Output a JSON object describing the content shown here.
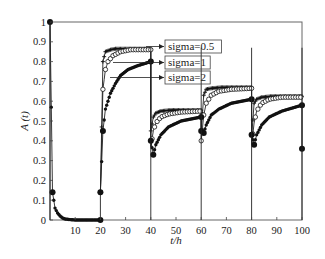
{
  "chart_data": {
    "type": "line",
    "title": "",
    "xlabel": "t/h",
    "ylabel": "A (t)",
    "xlim": [
      0,
      100
    ],
    "ylim": [
      0,
      1
    ],
    "xticks": [
      10,
      20,
      30,
      40,
      50,
      60,
      70,
      80,
      90,
      100
    ],
    "yticks": [
      0,
      0.1,
      0.2,
      0.3,
      0.4,
      0.5,
      0.6,
      0.7,
      0.8,
      0.9,
      1
    ],
    "grid": false,
    "legend_position": "annotations with arrows, upper middle",
    "series": [
      {
        "name": "sigma=0.5",
        "marker": "plus",
        "segments": [
          {
            "x": [
              20,
              21,
              22,
              24,
              26,
              30,
              35,
              40
            ],
            "y": [
              0.14,
              0.8,
              0.85,
              0.86,
              0.865,
              0.865,
              0.865,
              0.865
            ]
          },
          {
            "x": [
              40,
              41,
              42,
              44,
              48,
              55,
              60
            ],
            "y": [
              0.45,
              0.52,
              0.54,
              0.55,
              0.555,
              0.555,
              0.555
            ]
          },
          {
            "x": [
              60,
              61,
              62,
              64,
              68,
              75,
              80
            ],
            "y": [
              0.45,
              0.63,
              0.66,
              0.665,
              0.67,
              0.67,
              0.67
            ]
          },
          {
            "x": [
              80,
              81,
              82,
              84,
              88,
              95,
              100
            ],
            "y": [
              0.42,
              0.59,
              0.61,
              0.62,
              0.625,
              0.625,
              0.625
            ]
          }
        ]
      },
      {
        "name": "sigma=1",
        "marker": "circle",
        "segments": [
          {
            "x": [
              20,
              21,
              22,
              23,
              25,
              28,
              32,
              36,
              40
            ],
            "y": [
              0.14,
              0.66,
              0.76,
              0.8,
              0.83,
              0.85,
              0.86,
              0.86,
              0.86
            ]
          },
          {
            "x": [
              40,
              41,
              42,
              44,
              47,
              52,
              60
            ],
            "y": [
              0.37,
              0.45,
              0.49,
              0.52,
              0.535,
              0.545,
              0.55
            ]
          },
          {
            "x": [
              60,
              61,
              62,
              64,
              67,
              72,
              80
            ],
            "y": [
              0.4,
              0.53,
              0.59,
              0.63,
              0.65,
              0.66,
              0.665
            ]
          },
          {
            "x": [
              80,
              81,
              82,
              84,
              87,
              92,
              100
            ],
            "y": [
              0.38,
              0.49,
              0.55,
              0.59,
              0.61,
              0.62,
              0.62
            ]
          }
        ]
      },
      {
        "name": "sigma=2",
        "marker": "filled-circle",
        "segments": [
          {
            "x": [
              0,
              1,
              2,
              3,
              4,
              5,
              6,
              8,
              10,
              15,
              20
            ],
            "y": [
              1.0,
              0.14,
              0.06,
              0.035,
              0.02,
              0.01,
              0.005,
              0.002,
              0.0,
              0.0,
              0.0
            ]
          },
          {
            "x": [
              20,
              21,
              22,
              24,
              26,
              28,
              31,
              35,
              40
            ],
            "y": [
              0.14,
              0.45,
              0.56,
              0.64,
              0.69,
              0.73,
              0.76,
              0.78,
              0.8
            ]
          },
          {
            "x": [
              40,
              41,
              42,
              44,
              47,
              52,
              60
            ],
            "y": [
              0.4,
              0.33,
              0.38,
              0.43,
              0.47,
              0.5,
              0.52
            ]
          },
          {
            "x": [
              60,
              61,
              62,
              64,
              67,
              72,
              80
            ],
            "y": [
              0.45,
              0.44,
              0.48,
              0.53,
              0.56,
              0.59,
              0.61
            ]
          },
          {
            "x": [
              80,
              81,
              82,
              84,
              87,
              92,
              100
            ],
            "y": [
              0.43,
              0.38,
              0.43,
              0.48,
              0.52,
              0.55,
              0.58
            ]
          },
          {
            "x": [
              100
            ],
            "y": [
              0.36
            ]
          }
        ]
      }
    ],
    "annotations": [
      "sigma=0.5",
      "sigma=1",
      "sigma=2"
    ]
  },
  "legend": {
    "items": [
      {
        "label": "sigma=0.5"
      },
      {
        "label": "sigma=1"
      },
      {
        "label": "sigma=2"
      }
    ]
  },
  "axes": {
    "xlabel": "t/h",
    "ylabel": "A (t)"
  }
}
